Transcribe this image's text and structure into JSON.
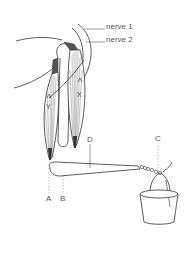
{
  "figure": {
    "labels": {
      "nerve1": "nerve 1",
      "nerve2": "nerve 2",
      "x": "X",
      "y": "Y",
      "a": "A",
      "b": "B",
      "c": "C",
      "d": "D"
    },
    "colors": {
      "line": "#333333",
      "label": "#555555",
      "dashed": "#888888",
      "tendon": "#444444",
      "background": "#ffffff"
    }
  }
}
